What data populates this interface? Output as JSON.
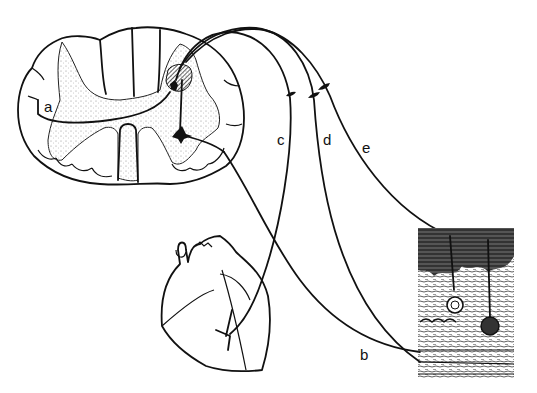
{
  "figure": {
    "labels": {
      "a": "a",
      "b": "b",
      "c": "c",
      "d": "d",
      "e": "e"
    },
    "colors": {
      "ink": "#111111",
      "background": "#ffffff",
      "gray_matter_stipple": "#9a9a9a",
      "dorsal_horn_hatch": "#333333"
    }
  }
}
